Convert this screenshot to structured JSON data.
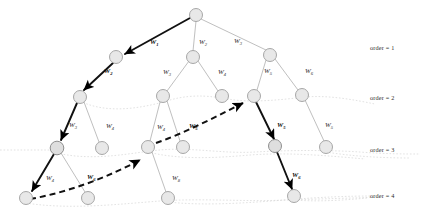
{
  "figure": {
    "type": "tree-diagram",
    "node_fill": "#e6e6e6",
    "node_stroke": "#9a9a9a",
    "edge_color": "#b0b0b0",
    "highlight_color": "#000000",
    "dotted_link_color": "#c9c9c9",
    "background": "#ffffff"
  },
  "order_labels": [
    {
      "text": "order = 1",
      "x": 18,
      "y": 44
    },
    {
      "text": "order = 2",
      "x": 18,
      "y": 94
    },
    {
      "text": "order = 3",
      "x": 18,
      "y": 146
    },
    {
      "text": "order = 4",
      "x": 18,
      "y": 192
    }
  ],
  "nodes": [
    {
      "id": "root",
      "order": 0,
      "x": 196,
      "y": 15,
      "r": 6.5
    },
    {
      "id": "n1-1",
      "order": 1,
      "x": 116,
      "y": 57,
      "r": 6.5
    },
    {
      "id": "n1-2",
      "order": 1,
      "x": 193,
      "y": 57,
      "r": 6.5
    },
    {
      "id": "n1-3",
      "order": 1,
      "x": 270,
      "y": 55,
      "r": 6.5
    },
    {
      "id": "n2-1",
      "order": 2,
      "x": 80,
      "y": 97,
      "r": 6.5
    },
    {
      "id": "n2-2",
      "order": 2,
      "x": 163,
      "y": 96,
      "r": 6.5
    },
    {
      "id": "n2-3",
      "order": 2,
      "x": 222,
      "y": 96,
      "r": 6.5
    },
    {
      "id": "n2-4",
      "order": 2,
      "x": 254,
      "y": 96,
      "r": 6.5
    },
    {
      "id": "n2-5",
      "order": 2,
      "x": 302,
      "y": 95,
      "r": 6.5
    },
    {
      "id": "n3-1",
      "order": 3,
      "x": 57,
      "y": 148,
      "r": 6.5
    },
    {
      "id": "n3-2",
      "order": 3,
      "x": 102,
      "y": 148,
      "r": 6.5
    },
    {
      "id": "n3-3",
      "order": 3,
      "x": 148,
      "y": 147,
      "r": 6.5
    },
    {
      "id": "n3-4",
      "order": 3,
      "x": 183,
      "y": 147,
      "r": 6.5
    },
    {
      "id": "n3-5",
      "order": 3,
      "x": 275,
      "y": 146,
      "r": 6.5
    },
    {
      "id": "n3-6",
      "order": 3,
      "x": 326,
      "y": 147,
      "r": 6.5
    },
    {
      "id": "n4-1",
      "order": 4,
      "x": 26,
      "y": 198,
      "r": 6.5
    },
    {
      "id": "n4-2",
      "order": 4,
      "x": 88,
      "y": 198,
      "r": 6.5
    },
    {
      "id": "n4-3",
      "order": 4,
      "x": 168,
      "y": 198,
      "r": 6.5
    },
    {
      "id": "n4-4",
      "order": 4,
      "x": 294,
      "y": 196,
      "r": 6.5
    }
  ],
  "edges": [
    {
      "from": "root",
      "to": "n1-1",
      "style": "highlight-solid",
      "label": "W",
      "sub": "1"
    },
    {
      "from": "root",
      "to": "n1-2",
      "style": "thin",
      "label": "W",
      "sub": "2"
    },
    {
      "from": "root",
      "to": "n1-3",
      "style": "thin",
      "label": "W",
      "sub": "3"
    },
    {
      "from": "n1-1",
      "to": "n2-1",
      "style": "highlight-solid",
      "label": "W",
      "sub": "2"
    },
    {
      "from": "n1-2",
      "to": "n2-2",
      "style": "thin",
      "label": "W",
      "sub": "3"
    },
    {
      "from": "n1-2",
      "to": "n2-3",
      "style": "thin",
      "label": "W",
      "sub": "4"
    },
    {
      "from": "n1-3",
      "to": "n2-4",
      "style": "thin",
      "label": "W",
      "sub": "5"
    },
    {
      "from": "n1-3",
      "to": "n2-5",
      "style": "thin",
      "label": "W",
      "sub": "6"
    },
    {
      "from": "n2-1",
      "to": "n3-1",
      "style": "highlight-solid",
      "label": "W",
      "sub": "3"
    },
    {
      "from": "n2-1",
      "to": "n3-2",
      "style": "thin",
      "label": "W",
      "sub": "4"
    },
    {
      "from": "n2-2",
      "to": "n3-3",
      "style": "thin",
      "label": "W",
      "sub": "4"
    },
    {
      "from": "n2-2",
      "to": "n3-4",
      "style": "thin",
      "label": "W",
      "sub": "5"
    },
    {
      "from": "n2-4",
      "to": "n3-5",
      "style": "highlight-solid",
      "label": "W",
      "sub": "5"
    },
    {
      "from": "n2-5",
      "to": "n3-6",
      "style": "thin",
      "label": "W",
      "sub": "5"
    },
    {
      "from": "n3-1",
      "to": "n4-1",
      "style": "highlight-solid",
      "label": "W",
      "sub": "4"
    },
    {
      "from": "n3-1",
      "to": "n4-2",
      "style": "thin",
      "label": "W",
      "sub": "6"
    },
    {
      "from": "n3-3",
      "to": "n4-3",
      "style": "thin",
      "label": "W",
      "sub": "8"
    },
    {
      "from": "n3-5",
      "to": "n4-4",
      "style": "highlight-solid",
      "label": "W",
      "sub": "6"
    }
  ],
  "dashed_path": {
    "style": "highlight-dashed",
    "points": [
      [
        26,
        197
      ],
      [
        140,
        165
      ],
      [
        150,
        148
      ],
      [
        178,
        130
      ],
      [
        245,
        100
      ]
    ],
    "arrow_at": [
      "n3-3",
      "n2-4"
    ],
    "label": "W",
    "sub": "5"
  },
  "dotted_links": {
    "description": "faint curves connecting nodes of equal order",
    "color": "#cccccc"
  },
  "edge_label_positions": [
    {
      "label": "W",
      "sub": "1",
      "x": 150,
      "y": 44,
      "bold": true
    },
    {
      "label": "W",
      "sub": "2",
      "x": 199,
      "y": 44,
      "bold": false
    },
    {
      "label": "W",
      "sub": "3",
      "x": 234,
      "y": 43,
      "bold": false
    },
    {
      "label": "W",
      "sub": "2",
      "x": 104,
      "y": 73,
      "bold": true
    },
    {
      "label": "W",
      "sub": "3",
      "x": 163,
      "y": 74,
      "bold": false
    },
    {
      "label": "W",
      "sub": "4",
      "x": 218,
      "y": 74,
      "bold": false
    },
    {
      "label": "W",
      "sub": "5",
      "x": 264,
      "y": 73,
      "bold": false
    },
    {
      "label": "W",
      "sub": "6",
      "x": 305,
      "y": 73,
      "bold": false
    },
    {
      "label": "W",
      "sub": "3",
      "x": 69,
      "y": 127,
      "bold": false
    },
    {
      "label": "W",
      "sub": "4",
      "x": 106,
      "y": 128,
      "bold": false
    },
    {
      "label": "W",
      "sub": "4",
      "x": 157,
      "y": 129,
      "bold": false
    },
    {
      "label": "W",
      "sub": "5",
      "x": 189,
      "y": 128,
      "bold": true
    },
    {
      "label": "W",
      "sub": "5",
      "x": 277,
      "y": 127,
      "bold": true
    },
    {
      "label": "W",
      "sub": "5",
      "x": 325,
      "y": 127,
      "bold": false
    },
    {
      "label": "W",
      "sub": "4",
      "x": 46,
      "y": 180,
      "bold": false
    },
    {
      "label": "W",
      "sub": "6",
      "x": 87,
      "y": 179,
      "bold": true
    },
    {
      "label": "W",
      "sub": "8",
      "x": 172,
      "y": 180,
      "bold": false
    },
    {
      "label": "W",
      "sub": "6",
      "x": 292,
      "y": 177,
      "bold": true
    }
  ]
}
